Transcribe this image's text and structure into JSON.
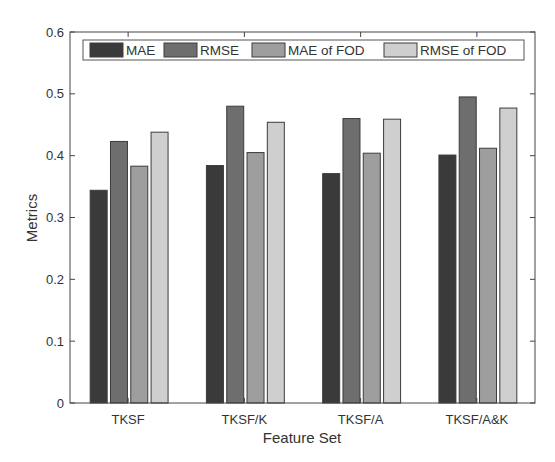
{
  "chart_data": {
    "type": "bar",
    "title": "",
    "xlabel": "Feature Set",
    "ylabel": "Metrics",
    "ylim": [
      0,
      0.6
    ],
    "yticks": [
      0,
      0.1,
      0.2,
      0.3,
      0.4,
      0.5,
      0.6
    ],
    "ytick_labels": [
      "0",
      "0.1",
      "0.2",
      "0.3",
      "0.4",
      "0.5",
      "0.6"
    ],
    "grid": false,
    "legend_position": "top-inside, horizontal",
    "categories": [
      "TKSF",
      "TKSF/K",
      "TKSF/A",
      "TKSF/A&K"
    ],
    "series": [
      {
        "name": "MAE",
        "color": "#3a3a3a",
        "values": [
          0.344,
          0.384,
          0.371,
          0.401
        ]
      },
      {
        "name": "RMSE",
        "color": "#6e6e6e",
        "values": [
          0.423,
          0.48,
          0.46,
          0.495
        ]
      },
      {
        "name": "MAE of FOD",
        "color": "#9e9e9e",
        "values": [
          0.383,
          0.405,
          0.404,
          0.412
        ]
      },
      {
        "name": "RMSE of FOD",
        "color": "#cfcfcf",
        "values": [
          0.438,
          0.454,
          0.459,
          0.477
        ]
      }
    ]
  }
}
